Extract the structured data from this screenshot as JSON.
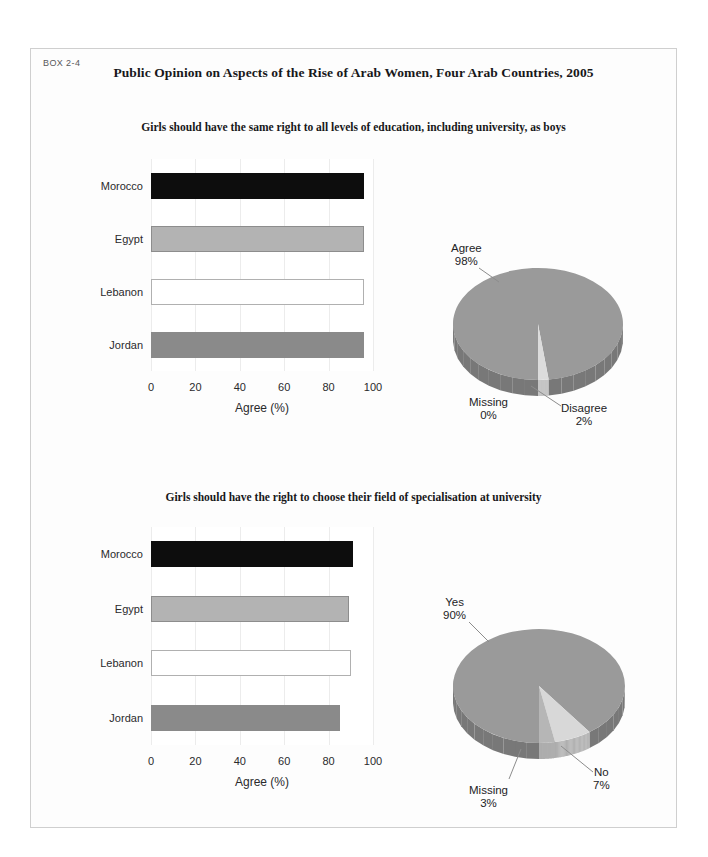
{
  "box": {
    "number": "BOX 2-4",
    "title": "Public Opinion on Aspects of the Rise of Arab Women, Four Arab Countries, 2005"
  },
  "panels": [
    {
      "subtitle": "Girls should have the same right to all levels of education, including university, as boys",
      "bar_chart": {
        "type": "bar",
        "orientation": "horizontal",
        "title": "",
        "xlabel": "Agree (%)",
        "ylabel": "",
        "categories": [
          "Morocco",
          "Egypt",
          "Lebanon",
          "Jordan"
        ],
        "values": [
          96,
          96,
          96,
          96
        ],
        "colors": [
          "#0d0d0d",
          "#b3b3b3",
          "#ffffff",
          "#8a8a8a"
        ],
        "xlim": [
          0,
          100
        ],
        "xticks": [
          0,
          20,
          40,
          60,
          80,
          100
        ],
        "grid": true,
        "legend": "none"
      },
      "pie_chart": {
        "type": "pie",
        "title": "",
        "labels": [
          "Agree",
          "Disagree",
          "Missing"
        ],
        "values": [
          98,
          2,
          0
        ],
        "display_values": [
          "98%",
          "2%",
          "0%"
        ],
        "colors": [
          "#9a9a9a",
          "#dcdcdc",
          "#c4c4c4"
        ],
        "legend": "callout-labels"
      }
    },
    {
      "subtitle": "Girls should have the right to choose their field of specialisation at university",
      "bar_chart": {
        "type": "bar",
        "orientation": "horizontal",
        "title": "",
        "xlabel": "Agree (%)",
        "ylabel": "",
        "categories": [
          "Morocco",
          "Egypt",
          "Lebanon",
          "Jordan"
        ],
        "values": [
          91,
          89,
          90,
          85
        ],
        "colors": [
          "#0d0d0d",
          "#b3b3b3",
          "#ffffff",
          "#8a8a8a"
        ],
        "xlim": [
          0,
          100
        ],
        "xticks": [
          0,
          20,
          40,
          60,
          80,
          100
        ],
        "grid": true,
        "legend": "none"
      },
      "pie_chart": {
        "type": "pie",
        "title": "",
        "labels": [
          "Yes",
          "No",
          "Missing"
        ],
        "values": [
          90,
          7,
          3
        ],
        "display_values": [
          "90%",
          "7%",
          "3%"
        ],
        "colors": [
          "#9a9a9a",
          "#d8d8d8",
          "#b6b6b6"
        ],
        "legend": "callout-labels"
      }
    }
  ],
  "chart_data": [
    {
      "type": "bar",
      "orientation": "horizontal",
      "title": "Girls should have the same right to all levels of education, including university, as boys",
      "categories": [
        "Morocco",
        "Egypt",
        "Lebanon",
        "Jordan"
      ],
      "values": [
        96,
        96,
        96,
        96
      ],
      "xlabel": "Agree (%)",
      "ylabel": "",
      "xlim": [
        0,
        100
      ],
      "xticks": [
        0,
        20,
        40,
        60,
        80,
        100
      ],
      "grid": true
    },
    {
      "type": "pie",
      "title": "Girls should have the same right to all levels of education, including university, as boys",
      "categories": [
        "Agree",
        "Disagree",
        "Missing"
      ],
      "values": [
        98,
        2,
        0
      ],
      "ylabel": "",
      "legend": "callout-labels"
    },
    {
      "type": "bar",
      "orientation": "horizontal",
      "title": "Girls should have the right to choose their field of specialisation at university",
      "categories": [
        "Morocco",
        "Egypt",
        "Lebanon",
        "Jordan"
      ],
      "values": [
        91,
        89,
        90,
        85
      ],
      "xlabel": "Agree (%)",
      "ylabel": "",
      "xlim": [
        0,
        100
      ],
      "xticks": [
        0,
        20,
        40,
        60,
        80,
        100
      ],
      "grid": true
    },
    {
      "type": "pie",
      "title": "Girls should have the right to choose their field of specialisation at university",
      "categories": [
        "Yes",
        "No",
        "Missing"
      ],
      "values": [
        90,
        7,
        3
      ],
      "ylabel": "",
      "legend": "callout-labels"
    }
  ]
}
